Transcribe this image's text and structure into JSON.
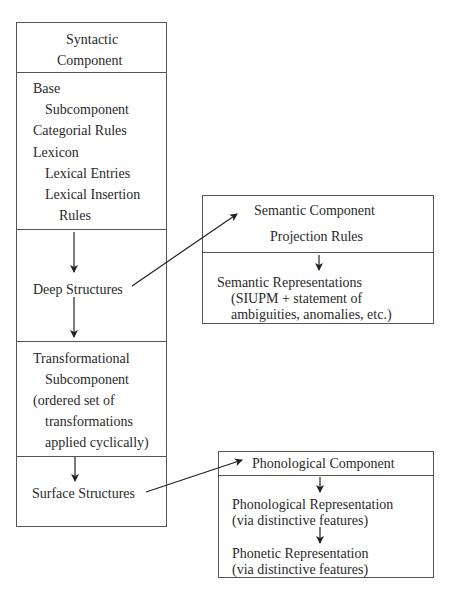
{
  "syntactic": {
    "title_line1": "Syntactic",
    "title_line2": "Component",
    "base": [
      "Base",
      "Subcomponent",
      "Categorial Rules",
      "Lexicon",
      "Lexical Entries",
      "Lexical Insertion",
      "Rules"
    ],
    "deep": "Deep Structures",
    "transformational": [
      "Transformational",
      "Subcomponent",
      "(ordered set of",
      "transformations",
      "applied cyclically)"
    ],
    "surface": "Surface Structures"
  },
  "semantic": {
    "title": "Semantic Component",
    "rules": "Projection Rules",
    "rep": [
      "Semantic Representations",
      "(SIUPM + statement of",
      "ambiguities, anomalies, etc.)"
    ]
  },
  "phonological": {
    "title": "Phonological Component",
    "rep1": [
      "Phonological Representation",
      "(via distinctive features)"
    ],
    "rep2": [
      "Phonetic Representation",
      "(via distinctive features)"
    ]
  }
}
